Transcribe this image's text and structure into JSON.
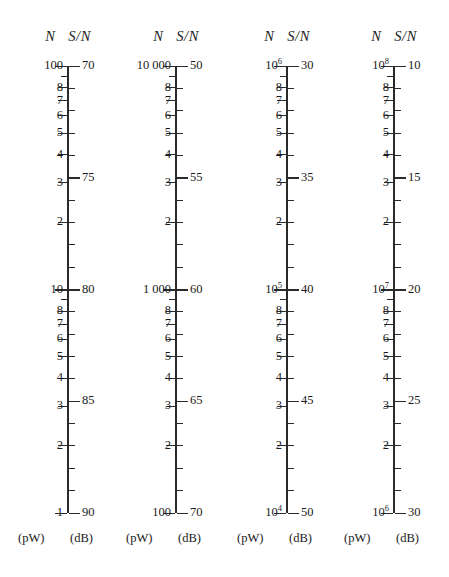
{
  "figure": {
    "type": "nomogram",
    "column_count": 4,
    "axis_top_y": 66,
    "axis_bottom_y": 513,
    "decade_count": 2,
    "header": {
      "left_symbol": "N",
      "right_symbol": "S/N"
    },
    "units": {
      "left": "(pW)",
      "right": "(dB)"
    },
    "log_minor_labels": [
      "8",
      "7",
      "6",
      "5",
      "4",
      "3",
      "2"
    ],
    "log_unlabeled_minor": [
      "9"
    ],
    "db_label_step": 5,
    "db_tick_step": 1,
    "db_span_per_decade": 10
  },
  "columns": [
    {
      "id": "col1",
      "axis_x": 68,
      "header_left": "N",
      "header_right": "S/N",
      "left_top": "100",
      "left_mid": "10",
      "left_bottom": "1",
      "left_top_html": "100",
      "left_mid_html": "10",
      "left_bottom_html": "1",
      "db_top": 70,
      "db_mid": 80,
      "db_bottom": 90,
      "db_labels": [
        "70",
        "75",
        "80",
        "85",
        "90"
      ],
      "unit_left": "(pW)",
      "unit_right": "(dB)"
    },
    {
      "id": "col2",
      "axis_x": 176,
      "header_left": "N",
      "header_right": "S/N",
      "left_top": "10 000",
      "left_mid": "1 000",
      "left_bottom": "100",
      "left_top_html": "10 000",
      "left_mid_html": "1 000",
      "left_bottom_html": "100",
      "db_top": 50,
      "db_mid": 60,
      "db_bottom": 70,
      "db_labels": [
        "50",
        "55",
        "60",
        "65",
        "70"
      ],
      "unit_left": "(pW)",
      "unit_right": "(dB)"
    },
    {
      "id": "col3",
      "axis_x": 287,
      "header_left": "N",
      "header_right": "S/N",
      "left_top": "10^6",
      "left_mid": "10^5",
      "left_bottom": "10^4",
      "left_top_html": "10<sup>6</sup>",
      "left_mid_html": "10<sup>5</sup>",
      "left_bottom_html": "10<sup>4</sup>",
      "db_top": 30,
      "db_mid": 40,
      "db_bottom": 50,
      "db_labels": [
        "30",
        "35",
        "40",
        "45",
        "50"
      ],
      "unit_left": "(pW)",
      "unit_right": "(dB)"
    },
    {
      "id": "col4",
      "axis_x": 394,
      "header_left": "N",
      "header_right": "S/N",
      "left_top": "10^8",
      "left_mid": "10^7",
      "left_bottom": "10^6",
      "left_top_html": "10<sup>8</sup>",
      "left_mid_html": "10<sup>7</sup>",
      "left_bottom_html": "10<sup>6</sup>",
      "db_top": 10,
      "db_mid": 20,
      "db_bottom": 30,
      "db_labels": [
        "10",
        "15",
        "20",
        "25",
        "30"
      ],
      "unit_left": "(pW)",
      "unit_right": "(dB)"
    }
  ],
  "colors": {
    "ink": "#2a2a2a",
    "background": "#ffffff"
  }
}
